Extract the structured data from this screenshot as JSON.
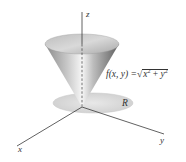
{
  "figure": {
    "type": "3d-surface-diagram",
    "axes": {
      "z_label": "z",
      "x_label": "x",
      "y_label": "y"
    },
    "region_label": "R",
    "function": {
      "lhs": "f(x, y) =",
      "sqrt_symbol": "√",
      "radicand": "x2 + y2",
      "radicand_parts": {
        "a": "x",
        "a_exp": "2",
        "op": " + ",
        "b": "y",
        "b_exp": "2"
      }
    },
    "colors": {
      "axis": "#3a3a3a",
      "cone_light": "#f4f4f4",
      "cone_dark": "#6e6e6e",
      "disk_fill": "#dedede",
      "text": "#333333"
    }
  }
}
